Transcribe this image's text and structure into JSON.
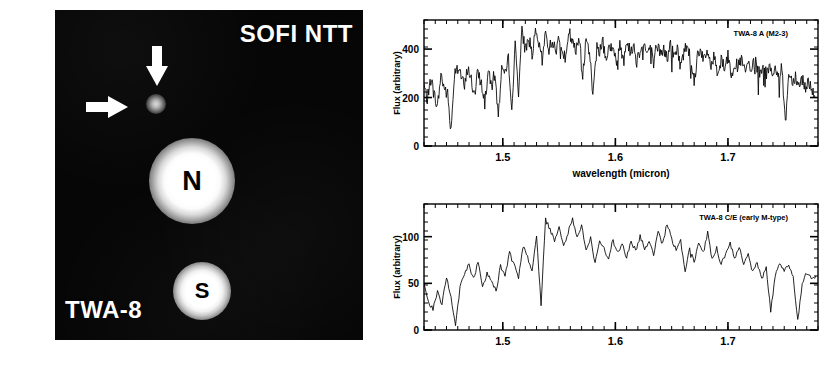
{
  "figure": {
    "caption_none": ""
  },
  "image_panel": {
    "instrument_label": "SOFI NTT",
    "target_label": "TWA-8",
    "stars": [
      {
        "id": "N",
        "label": "N",
        "name": "twa-8-north"
      },
      {
        "id": "S",
        "label": "S",
        "name": "twa-8-south"
      }
    ],
    "annotations": [
      {
        "name": "down-arrow",
        "points_to": "faint companion"
      },
      {
        "name": "right-arrow",
        "points_to": "faint companion"
      }
    ],
    "background_color": "#050505",
    "overlay_color": "#ffffff"
  },
  "chart_data": [
    {
      "type": "line",
      "name": "twa-8-a-spectrum",
      "title": "TWA-8 A (M2-3)",
      "xlabel": "wavelength (micron)",
      "ylabel": "Flux (arbitrary)",
      "xlim": [
        1.43,
        1.78
      ],
      "ylim": [
        0,
        520
      ],
      "xticks": [
        1.5,
        1.6,
        1.7
      ],
      "xticklabels": [
        "1.5",
        "1.6",
        "1.7"
      ],
      "yticks": [
        0,
        200,
        400
      ],
      "yticklabels": [
        "0",
        "200",
        "400"
      ],
      "grid": false,
      "legend": "none",
      "line_color": "#000000",
      "x": [
        1.43,
        1.433,
        1.436,
        1.439,
        1.442,
        1.445,
        1.448,
        1.451,
        1.454,
        1.457,
        1.46,
        1.463,
        1.466,
        1.469,
        1.472,
        1.475,
        1.478,
        1.481,
        1.484,
        1.487,
        1.49,
        1.493,
        1.496,
        1.499,
        1.502,
        1.505,
        1.508,
        1.511,
        1.514,
        1.517,
        1.52,
        1.523,
        1.526,
        1.529,
        1.532,
        1.535,
        1.538,
        1.541,
        1.544,
        1.547,
        1.55,
        1.553,
        1.556,
        1.559,
        1.562,
        1.565,
        1.568,
        1.571,
        1.574,
        1.577,
        1.58,
        1.583,
        1.586,
        1.589,
        1.592,
        1.595,
        1.598,
        1.601,
        1.604,
        1.607,
        1.61,
        1.613,
        1.616,
        1.619,
        1.622,
        1.625,
        1.628,
        1.631,
        1.634,
        1.637,
        1.64,
        1.643,
        1.646,
        1.649,
        1.652,
        1.655,
        1.658,
        1.661,
        1.664,
        1.667,
        1.67,
        1.673,
        1.676,
        1.679,
        1.682,
        1.685,
        1.688,
        1.691,
        1.694,
        1.697,
        1.7,
        1.703,
        1.706,
        1.709,
        1.712,
        1.715,
        1.718,
        1.721,
        1.724,
        1.727,
        1.73,
        1.733,
        1.736,
        1.739,
        1.742,
        1.745,
        1.748,
        1.751,
        1.754,
        1.757,
        1.76,
        1.763,
        1.766,
        1.769,
        1.772,
        1.775,
        1.778
      ],
      "y": [
        250,
        190,
        275,
        215,
        160,
        295,
        240,
        210,
        60,
        300,
        345,
        290,
        240,
        330,
        270,
        205,
        310,
        255,
        185,
        300,
        250,
        300,
        120,
        330,
        290,
        360,
        170,
        410,
        230,
        470,
        400,
        450,
        380,
        460,
        420,
        350,
        470,
        400,
        440,
        380,
        460,
        410,
        350,
        470,
        420,
        390,
        455,
        300,
        430,
        400,
        200,
        420,
        390,
        440,
        360,
        420,
        390,
        340,
        420,
        370,
        430,
        390,
        420,
        350,
        400,
        430,
        380,
        410,
        350,
        420,
        380,
        400,
        360,
        420,
        370,
        400,
        330,
        390,
        420,
        370,
        260,
        380,
        400,
        350,
        390,
        330,
        370,
        300,
        360,
        330,
        370,
        300,
        350,
        320,
        360,
        300,
        340,
        310,
        350,
        300,
        320,
        290,
        340,
        300,
        330,
        280,
        320,
        90,
        300,
        270,
        290,
        250,
        280,
        240,
        270,
        230,
        200
      ]
    },
    {
      "type": "line",
      "name": "twa-8-ce-spectrum",
      "title": "TWA-8 C/E (early M-type)",
      "xlabel": "",
      "ylabel": "Flux (arbitrary)",
      "xlim": [
        1.43,
        1.78
      ],
      "ylim": [
        0,
        135
      ],
      "xticks": [
        1.5,
        1.6,
        1.7
      ],
      "xticklabels": [
        "1.5",
        "1.6",
        "1.7"
      ],
      "yticks": [
        0,
        50,
        100
      ],
      "yticklabels": [
        "0",
        "50",
        "100"
      ],
      "grid": false,
      "legend": "none",
      "line_color": "#000000",
      "x": [
        1.43,
        1.434,
        1.438,
        1.442,
        1.446,
        1.45,
        1.454,
        1.458,
        1.462,
        1.466,
        1.47,
        1.474,
        1.478,
        1.482,
        1.486,
        1.49,
        1.494,
        1.498,
        1.502,
        1.506,
        1.51,
        1.514,
        1.518,
        1.522,
        1.526,
        1.53,
        1.534,
        1.538,
        1.542,
        1.546,
        1.55,
        1.554,
        1.558,
        1.562,
        1.566,
        1.57,
        1.574,
        1.578,
        1.582,
        1.586,
        1.59,
        1.594,
        1.598,
        1.602,
        1.606,
        1.61,
        1.614,
        1.618,
        1.622,
        1.626,
        1.63,
        1.634,
        1.638,
        1.642,
        1.646,
        1.65,
        1.654,
        1.658,
        1.662,
        1.666,
        1.67,
        1.674,
        1.678,
        1.682,
        1.686,
        1.69,
        1.694,
        1.698,
        1.702,
        1.706,
        1.71,
        1.714,
        1.718,
        1.722,
        1.726,
        1.73,
        1.734,
        1.738,
        1.742,
        1.746,
        1.75,
        1.754,
        1.758,
        1.762,
        1.766,
        1.77,
        1.774,
        1.778
      ],
      "y": [
        48,
        30,
        22,
        40,
        28,
        58,
        35,
        5,
        45,
        62,
        70,
        55,
        72,
        48,
        60,
        52,
        42,
        68,
        58,
        82,
        70,
        55,
        90,
        78,
        62,
        100,
        28,
        118,
        108,
        95,
        112,
        90,
        105,
        120,
        98,
        112,
        85,
        100,
        70,
        95,
        88,
        75,
        98,
        82,
        92,
        78,
        95,
        85,
        100,
        88,
        95,
        80,
        105,
        92,
        115,
        98,
        85,
        95,
        60,
        88,
        72,
        95,
        82,
        105,
        75,
        88,
        70,
        82,
        92,
        78,
        88,
        70,
        80,
        62,
        72,
        55,
        68,
        20,
        58,
        72,
        62,
        70,
        55,
        10,
        48,
        62,
        55,
        58
      ]
    }
  ]
}
